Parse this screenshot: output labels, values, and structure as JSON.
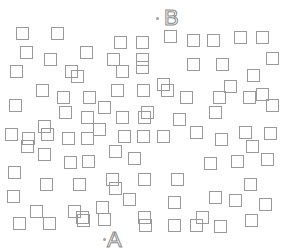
{
  "labels": {
    "a": {
      "text": "A",
      "x": 107,
      "y": 229,
      "dot_x": 103,
      "dot_y": 238
    },
    "b": {
      "text": "B",
      "x": 164,
      "y": 7,
      "dot_x": 156,
      "dot_y": 17
    }
  },
  "square_size": 12,
  "squares": [
    [
      16,
      27
    ],
    [
      51,
      27
    ],
    [
      114,
      36
    ],
    [
      136,
      36
    ],
    [
      164,
      30
    ],
    [
      187,
      34
    ],
    [
      207,
      34
    ],
    [
      234,
      31
    ],
    [
      256,
      31
    ],
    [
      20,
      46
    ],
    [
      80,
      46
    ],
    [
      44,
      53
    ],
    [
      107,
      53
    ],
    [
      136,
      53
    ],
    [
      187,
      58
    ],
    [
      216,
      58
    ],
    [
      266,
      52
    ],
    [
      10,
      65
    ],
    [
      65,
      65
    ],
    [
      116,
      65
    ],
    [
      136,
      61
    ],
    [
      247,
      69
    ],
    [
      71,
      70
    ],
    [
      157,
      78
    ],
    [
      224,
      80
    ],
    [
      36,
      84
    ],
    [
      111,
      84
    ],
    [
      137,
      84
    ],
    [
      161,
      84
    ],
    [
      256,
      88
    ],
    [
      57,
      91
    ],
    [
      83,
      91
    ],
    [
      180,
      91
    ],
    [
      213,
      91
    ],
    [
      243,
      91
    ],
    [
      9,
      99
    ],
    [
      266,
      99
    ],
    [
      98,
      101
    ],
    [
      59,
      106
    ],
    [
      141,
      106
    ],
    [
      209,
      106
    ],
    [
      81,
      111
    ],
    [
      116,
      111
    ],
    [
      138,
      111
    ],
    [
      173,
      113
    ],
    [
      38,
      120
    ],
    [
      93,
      123
    ],
    [
      5,
      128
    ],
    [
      41,
      128
    ],
    [
      118,
      130
    ],
    [
      137,
      130
    ],
    [
      157,
      130
    ],
    [
      190,
      126
    ],
    [
      239,
      126
    ],
    [
      215,
      133
    ],
    [
      264,
      127
    ],
    [
      22,
      132
    ],
    [
      62,
      132
    ],
    [
      81,
      132
    ],
    [
      246,
      140
    ],
    [
      109,
      145
    ],
    [
      21,
      140
    ],
    [
      38,
      148
    ],
    [
      64,
      156
    ],
    [
      128,
      152
    ],
    [
      82,
      155
    ],
    [
      204,
      157
    ],
    [
      231,
      155
    ],
    [
      261,
      153
    ],
    [
      8,
      166
    ],
    [
      106,
      173
    ],
    [
      138,
      173
    ],
    [
      171,
      173
    ],
    [
      40,
      178
    ],
    [
      73,
      178
    ],
    [
      244,
      178
    ],
    [
      109,
      182
    ],
    [
      7,
      190
    ],
    [
      123,
      193
    ],
    [
      168,
      196
    ],
    [
      209,
      191
    ],
    [
      229,
      194
    ],
    [
      259,
      198
    ],
    [
      30,
      205
    ],
    [
      68,
      205
    ],
    [
      96,
      201
    ],
    [
      76,
      211
    ],
    [
      138,
      211
    ],
    [
      196,
      211
    ],
    [
      13,
      217
    ],
    [
      43,
      217
    ],
    [
      77,
      214
    ],
    [
      98,
      213
    ],
    [
      139,
      219
    ],
    [
      168,
      219
    ],
    [
      190,
      219
    ],
    [
      214,
      220
    ],
    [
      245,
      214
    ]
  ]
}
